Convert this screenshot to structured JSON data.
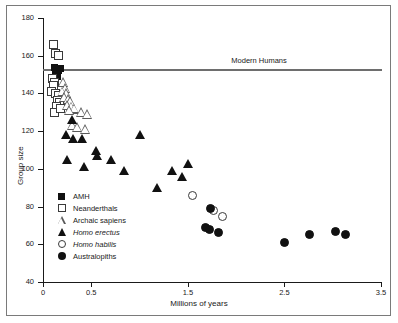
{
  "chart_data": {
    "type": "scatter",
    "title": "",
    "xlabel": "Millions of years",
    "ylabel": "Group size",
    "xlim": [
      0,
      3.5
    ],
    "ylim": [
      40,
      180
    ],
    "xticks": [
      0,
      0.5,
      1.5,
      2.5,
      3.5
    ],
    "xtick_labels": [
      "0",
      "0.5",
      "1.5",
      "2.5",
      "3.5"
    ],
    "yticks": [
      40,
      60,
      80,
      100,
      120,
      140,
      160,
      180
    ],
    "ytick_labels": [
      "40",
      "60",
      "80",
      "100",
      "120",
      "140",
      "160",
      "180"
    ],
    "grid": false,
    "legend_position": "lower-left-inside",
    "annotations": [
      {
        "text": "Modern Humans",
        "x": 1.95,
        "y": 157,
        "kind": "reference-line-label"
      }
    ],
    "reference_lines": [
      {
        "name": "modern-humans-line",
        "orientation": "horizontal",
        "y": 153,
        "color": "#6e6e6e"
      }
    ],
    "series": [
      {
        "name": "AMH",
        "marker": "filled-square",
        "color": "#111111",
        "points": [
          {
            "x": 0.12,
            "y": 154
          },
          {
            "x": 0.14,
            "y": 153
          },
          {
            "x": 0.16,
            "y": 152
          },
          {
            "x": 0.18,
            "y": 153
          },
          {
            "x": 0.13,
            "y": 150
          },
          {
            "x": 0.15,
            "y": 149
          }
        ]
      },
      {
        "name": "Neanderthals",
        "marker": "open-square",
        "color": "#3a3a3a",
        "points": [
          {
            "x": 0.11,
            "y": 166
          },
          {
            "x": 0.13,
            "y": 161
          },
          {
            "x": 0.16,
            "y": 160
          },
          {
            "x": 0.1,
            "y": 148
          },
          {
            "x": 0.12,
            "y": 146
          },
          {
            "x": 0.11,
            "y": 144
          },
          {
            "x": 0.09,
            "y": 141
          },
          {
            "x": 0.13,
            "y": 140
          },
          {
            "x": 0.16,
            "y": 139
          },
          {
            "x": 0.15,
            "y": 136
          },
          {
            "x": 0.17,
            "y": 135
          },
          {
            "x": 0.14,
            "y": 133
          },
          {
            "x": 0.12,
            "y": 130
          },
          {
            "x": 0.18,
            "y": 132
          }
        ]
      },
      {
        "name": "Archaic sapiens",
        "marker": "open-triangle",
        "color": "#5a5a5a",
        "points": [
          {
            "x": 0.21,
            "y": 146
          },
          {
            "x": 0.23,
            "y": 143
          },
          {
            "x": 0.2,
            "y": 141
          },
          {
            "x": 0.24,
            "y": 140
          },
          {
            "x": 0.22,
            "y": 138
          },
          {
            "x": 0.26,
            "y": 137
          },
          {
            "x": 0.28,
            "y": 136
          },
          {
            "x": 0.25,
            "y": 134
          },
          {
            "x": 0.3,
            "y": 133
          },
          {
            "x": 0.33,
            "y": 132
          },
          {
            "x": 0.27,
            "y": 131
          },
          {
            "x": 0.4,
            "y": 130
          },
          {
            "x": 0.46,
            "y": 129
          },
          {
            "x": 0.31,
            "y": 123
          },
          {
            "x": 0.36,
            "y": 122
          },
          {
            "x": 0.44,
            "y": 121
          }
        ]
      },
      {
        "name": "Homo erectus",
        "marker": "filled-triangle",
        "color": "#111111",
        "points": [
          {
            "x": 0.3,
            "y": 126
          },
          {
            "x": 0.24,
            "y": 118
          },
          {
            "x": 0.31,
            "y": 116
          },
          {
            "x": 0.4,
            "y": 116
          },
          {
            "x": 0.25,
            "y": 105
          },
          {
            "x": 0.55,
            "y": 110
          },
          {
            "x": 0.56,
            "y": 107
          },
          {
            "x": 0.42,
            "y": 101
          },
          {
            "x": 0.7,
            "y": 105
          },
          {
            "x": 0.84,
            "y": 99
          },
          {
            "x": 1.0,
            "y": 118
          },
          {
            "x": 1.34,
            "y": 99
          },
          {
            "x": 1.44,
            "y": 96
          },
          {
            "x": 1.5,
            "y": 103
          },
          {
            "x": 1.18,
            "y": 90
          }
        ]
      },
      {
        "name": "Homo habilis",
        "marker": "open-circle",
        "color": "#3a3a3a",
        "points": [
          {
            "x": 1.55,
            "y": 86
          },
          {
            "x": 1.77,
            "y": 78
          },
          {
            "x": 1.86,
            "y": 75
          }
        ]
      },
      {
        "name": "Australopiths",
        "marker": "filled-circle",
        "color": "#111111",
        "points": [
          {
            "x": 1.73,
            "y": 79
          },
          {
            "x": 1.68,
            "y": 69
          },
          {
            "x": 1.72,
            "y": 68
          },
          {
            "x": 1.82,
            "y": 66
          },
          {
            "x": 2.5,
            "y": 61
          },
          {
            "x": 2.76,
            "y": 65
          },
          {
            "x": 3.03,
            "y": 67
          },
          {
            "x": 3.13,
            "y": 65
          }
        ]
      }
    ]
  },
  "legend": {
    "items": [
      {
        "label": "AMH",
        "marker": "filled-square",
        "italic": false
      },
      {
        "label": "Neanderthals",
        "marker": "open-square",
        "italic": false
      },
      {
        "label": "Archaic sapiens",
        "marker": "open-triangle",
        "italic": false
      },
      {
        "label": "Homo erectus",
        "marker": "filled-triangle",
        "italic": true
      },
      {
        "label": "Homo habilis",
        "marker": "open-circle",
        "italic": true
      },
      {
        "label": "Australopiths",
        "marker": "filled-circle",
        "italic": false
      }
    ]
  }
}
